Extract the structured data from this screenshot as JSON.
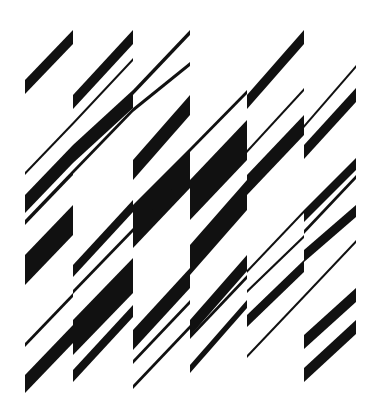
{
  "artwork": {
    "title": "Diagonal stripe composition",
    "background": "#ffffff",
    "ink": "#111111",
    "width": 379,
    "height": 410,
    "columns": [
      {
        "x0": 25,
        "x1": 73
      },
      {
        "x0": 73,
        "x1": 133
      },
      {
        "x0": 133,
        "x1": 190
      },
      {
        "x0": 190,
        "x1": 247
      },
      {
        "x0": 247,
        "x1": 304
      },
      {
        "x0": 304,
        "x1": 356
      }
    ],
    "stripes": [
      {
        "col": 0,
        "yTopAtX0": 80,
        "yTopAtX1": 30,
        "thick": 14
      },
      {
        "col": 0,
        "yTopAtX0": 172,
        "yTopAtX1": 122,
        "thick": 3
      },
      {
        "col": 0,
        "yTopAtX0": 195,
        "yTopAtX1": 145,
        "thick": 18
      },
      {
        "col": 0,
        "yTopAtX0": 220,
        "yTopAtX1": 170,
        "thick": 5
      },
      {
        "col": 0,
        "yTopAtX0": 255,
        "yTopAtX1": 205,
        "thick": 30
      },
      {
        "col": 0,
        "yTopAtX0": 343,
        "yTopAtX1": 293,
        "thick": 4
      },
      {
        "col": 0,
        "yTopAtX0": 375,
        "yTopAtX1": 325,
        "thick": 18
      },
      {
        "col": 1,
        "yTopAtX0": 95,
        "yTopAtX1": 30,
        "thick": 14
      },
      {
        "col": 1,
        "yTopAtX0": 122,
        "yTopAtX1": 58,
        "thick": 3
      },
      {
        "col": 1,
        "yTopAtX0": 145,
        "yTopAtX1": 90,
        "thick": 18
      },
      {
        "col": 1,
        "yTopAtX0": 170,
        "yTopAtX1": 108,
        "thick": 4
      },
      {
        "col": 1,
        "yTopAtX0": 265,
        "yTopAtX1": 200,
        "thick": 12
      },
      {
        "col": 1,
        "yTopAtX0": 290,
        "yTopAtX1": 228,
        "thick": 4
      },
      {
        "col": 1,
        "yTopAtX0": 320,
        "yTopAtX1": 258,
        "thick": 35
      },
      {
        "col": 1,
        "yTopAtX0": 370,
        "yTopAtX1": 305,
        "thick": 12
      },
      {
        "col": 2,
        "yTopAtX0": 90,
        "yTopAtX1": 30,
        "thick": 5
      },
      {
        "col": 2,
        "yTopAtX0": 108,
        "yTopAtX1": 62,
        "thick": 4
      },
      {
        "col": 2,
        "yTopAtX0": 160,
        "yTopAtX1": 95,
        "thick": 20
      },
      {
        "col": 2,
        "yTopAtX0": 205,
        "yTopAtX1": 148,
        "thick": 30
      },
      {
        "col": 2,
        "yTopAtX0": 230,
        "yTopAtX1": 170,
        "thick": 18
      },
      {
        "col": 2,
        "yTopAtX0": 330,
        "yTopAtX1": 268,
        "thick": 20
      },
      {
        "col": 2,
        "yTopAtX0": 360,
        "yTopAtX1": 300,
        "thick": 4
      },
      {
        "col": 2,
        "yTopAtX0": 385,
        "yTopAtX1": 325,
        "thick": 4
      },
      {
        "col": 3,
        "yTopAtX0": 148,
        "yTopAtX1": 90,
        "thick": 4
      },
      {
        "col": 3,
        "yTopAtX0": 180,
        "yTopAtX1": 120,
        "thick": 40
      },
      {
        "col": 3,
        "yTopAtX0": 245,
        "yTopAtX1": 180,
        "thick": 30
      },
      {
        "col": 3,
        "yTopAtX0": 320,
        "yTopAtX1": 255,
        "thick": 16
      },
      {
        "col": 3,
        "yTopAtX0": 335,
        "yTopAtX1": 275,
        "thick": 4
      },
      {
        "col": 3,
        "yTopAtX0": 365,
        "yTopAtX1": 300,
        "thick": 8
      },
      {
        "col": 4,
        "yTopAtX0": 95,
        "yTopAtX1": 30,
        "thick": 14
      },
      {
        "col": 4,
        "yTopAtX0": 150,
        "yTopAtX1": 88,
        "thick": 3
      },
      {
        "col": 4,
        "yTopAtX0": 175,
        "yTopAtX1": 115,
        "thick": 20
      },
      {
        "col": 4,
        "yTopAtX0": 270,
        "yTopAtX1": 210,
        "thick": 3
      },
      {
        "col": 4,
        "yTopAtX0": 290,
        "yTopAtX1": 235,
        "thick": 3
      },
      {
        "col": 4,
        "yTopAtX0": 315,
        "yTopAtX1": 260,
        "thick": 12
      },
      {
        "col": 4,
        "yTopAtX0": 355,
        "yTopAtX1": 295,
        "thick": 3
      },
      {
        "col": 5,
        "yTopAtX0": 125,
        "yTopAtX1": 65,
        "thick": 3
      },
      {
        "col": 5,
        "yTopAtX0": 145,
        "yTopAtX1": 88,
        "thick": 14
      },
      {
        "col": 5,
        "yTopAtX0": 210,
        "yTopAtX1": 158,
        "thick": 12
      },
      {
        "col": 5,
        "yTopAtX0": 230,
        "yTopAtX1": 175,
        "thick": 4
      },
      {
        "col": 5,
        "yTopAtX0": 250,
        "yTopAtX1": 205,
        "thick": 12
      },
      {
        "col": 5,
        "yTopAtX0": 295,
        "yTopAtX1": 240,
        "thick": 3
      },
      {
        "col": 5,
        "yTopAtX0": 335,
        "yTopAtX1": 288,
        "thick": 14
      },
      {
        "col": 5,
        "yTopAtX0": 368,
        "yTopAtX1": 320,
        "thick": 14
      }
    ]
  }
}
